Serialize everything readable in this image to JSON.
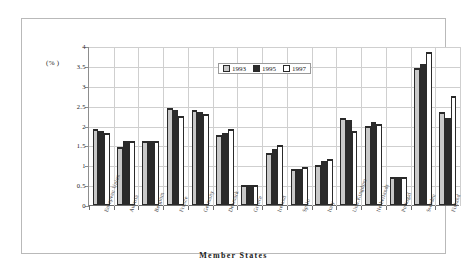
{
  "chart_data": {
    "type": "bar",
    "title": "",
    "xlabel": "Member States",
    "ylabel": "(%)",
    "ylim": [
      0,
      4
    ],
    "yticks": [
      "0",
      "0.5",
      "1",
      "1.5",
      "2",
      "2.5",
      "3",
      "3.5",
      "4"
    ],
    "grid": true,
    "legend_position": "top-center",
    "categories": [
      "European Union",
      "Austria",
      "Belgium",
      "France",
      "Germany",
      "Denmark",
      "Greece",
      "Ireland",
      "Spain",
      "Italy",
      "Unit.Kingdom",
      "Netherlands",
      "Portugal",
      "Sweden",
      "Finland"
    ],
    "series": [
      {
        "name": "1993",
        "color": "#c9c9c9",
        "values": [
          1.9,
          1.45,
          1.6,
          2.45,
          2.4,
          1.75,
          0.5,
          1.3,
          0.9,
          1.0,
          2.2,
          2.0,
          0.7,
          3.45,
          2.35
        ]
      },
      {
        "name": "1995",
        "color": "#2b2b2b",
        "values": [
          1.85,
          1.6,
          1.6,
          2.4,
          2.35,
          1.8,
          0.5,
          1.4,
          0.9,
          1.1,
          2.15,
          2.1,
          0.7,
          3.55,
          2.2
        ]
      },
      {
        "name": "1997",
        "color": "#ffffff",
        "values": [
          1.8,
          1.6,
          1.6,
          2.25,
          2.3,
          1.9,
          0.5,
          1.5,
          0.95,
          1.15,
          1.85,
          2.05,
          0.7,
          3.85,
          2.75
        ]
      }
    ]
  },
  "axis": {
    "unit_label": "(% )",
    "x_title": "Member States"
  },
  "legend": {
    "entries": [
      {
        "label": "1993",
        "swatch": "light-gray"
      },
      {
        "label": "1995",
        "swatch": "dark-gray"
      },
      {
        "label": "1997",
        "swatch": "white"
      }
    ]
  }
}
